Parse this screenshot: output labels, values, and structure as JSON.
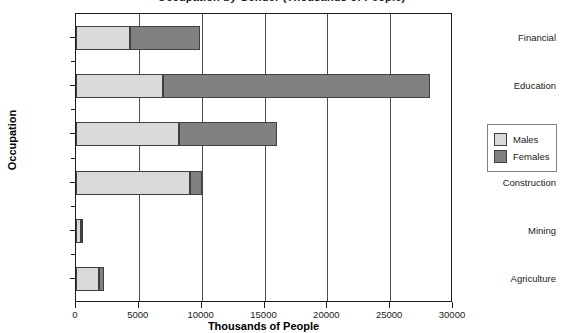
{
  "chart_data": {
    "type": "bar",
    "orientation": "horizontal",
    "stacked": true,
    "title": "Occupation by Gender (Thousands of People)",
    "xlabel": "Thousands of People",
    "ylabel": "Occupation",
    "categories": [
      "Agriculture",
      "Mining",
      "Construction",
      "Retail Trade",
      "Education",
      "Financial"
    ],
    "series": [
      {
        "name": "Males",
        "color": "#d9d9d9",
        "values": [
          1800,
          400,
          9100,
          8200,
          6900,
          4300
        ]
      },
      {
        "name": "Females",
        "color": "#808080",
        "values": [
          450,
          150,
          900,
          7800,
          21300,
          5600
        ]
      }
    ],
    "totals": [
      2250,
      550,
      10000,
      16000,
      28200,
      9900
    ],
    "xlim": [
      0,
      30000
    ],
    "xticks": [
      0,
      5000,
      10000,
      15000,
      20000,
      25000,
      30000
    ],
    "xtick_labels": [
      "0",
      "5000",
      "10000",
      "15000",
      "20000",
      "25000",
      "30000"
    ],
    "grid": "vertical",
    "legend_position": "right"
  },
  "axes": {
    "y_title": "Occupation",
    "x_title": "Thousands of People",
    "y_categories": [
      {
        "label": "Financial"
      },
      {
        "label": "Education"
      },
      {
        "label": "Retail Trade"
      },
      {
        "label": "Construction"
      },
      {
        "label": "Mining"
      },
      {
        "label": "Agriculture"
      }
    ],
    "x_labels": [
      "0",
      "5000",
      "10000",
      "15000",
      "20000",
      "25000",
      "30000"
    ]
  },
  "legend": {
    "entries": [
      {
        "label": "Males",
        "color": "#d9d9d9"
      },
      {
        "label": "Females",
        "color": "#808080"
      }
    ]
  },
  "title": "Occupation by Gender (Thousands of People)"
}
